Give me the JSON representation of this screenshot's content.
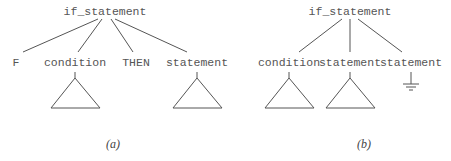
{
  "diagrams": {
    "a": {
      "caption": "(a)",
      "root": {
        "label": "if_statement",
        "x": 105,
        "y": 6
      },
      "children": [
        {
          "label": "F",
          "x": 16,
          "y": 57,
          "subtree": "none"
        },
        {
          "label": "condition",
          "x": 75,
          "y": 57,
          "subtree": "triangle"
        },
        {
          "label": "THEN",
          "x": 136,
          "y": 57,
          "subtree": "none"
        },
        {
          "label": "statement",
          "x": 197,
          "y": 57,
          "subtree": "triangle"
        }
      ]
    },
    "b": {
      "caption": "(b)",
      "root": {
        "label": "if_statement",
        "x": 350,
        "y": 6
      },
      "children": [
        {
          "label": "condition",
          "x": 289,
          "y": 57,
          "subtree": "triangle"
        },
        {
          "label": "statement",
          "x": 350,
          "y": 57,
          "subtree": "triangle"
        },
        {
          "label": "statement",
          "x": 411,
          "y": 57,
          "subtree": "ground"
        }
      ]
    }
  },
  "colors": {
    "stroke": "#555555",
    "text": "#555555",
    "background": "#ffffff"
  }
}
